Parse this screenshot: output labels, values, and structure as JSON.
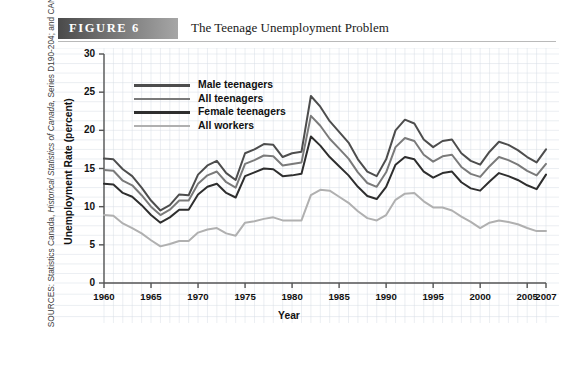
{
  "figure": {
    "banner_label": "FIGURE 6",
    "title": "The Teenage Unemployment Problem"
  },
  "source_note": {
    "prefix": "SOURCES: Statistics Canada, ",
    "italic": "Historical Statistics of Canada,",
    "suffix": " Series D190-204; and CANSIM II, Table 282-0002."
  },
  "colors": {
    "male_teenagers": "#4d4d4d",
    "all_teenagers": "#7a7a7a",
    "female_teenagers": "#2e2e2e",
    "all_workers": "#b0b0b0",
    "grid": "#d7dce4",
    "axis": "#555555",
    "banner_dark": "#4a4a4a",
    "banner_light": "#a6a6a6"
  },
  "chart_data": {
    "type": "line",
    "title": "The Teenage Unemployment Problem",
    "xlabel": "Year",
    "ylabel": "Unemployment Rate (percent)",
    "xlim": [
      1960,
      2007
    ],
    "ylim": [
      0,
      30
    ],
    "ytick_labels": [
      "0",
      "5",
      "10",
      "15",
      "20",
      "25",
      "30"
    ],
    "yticks": [
      0,
      5,
      10,
      15,
      20,
      25,
      30
    ],
    "xtick_labels": [
      "1960",
      "1965",
      "1970",
      "1975",
      "1980",
      "1985",
      "1990",
      "1995",
      "2000",
      "2005",
      "2007"
    ],
    "xticks": [
      1960,
      1965,
      1970,
      1975,
      1980,
      1985,
      1990,
      1995,
      2000,
      2005,
      2007
    ],
    "grid": true,
    "legend_position": "upper-left-inside",
    "x": [
      1960,
      1961,
      1962,
      1963,
      1964,
      1965,
      1966,
      1967,
      1968,
      1969,
      1970,
      1971,
      1972,
      1973,
      1974,
      1975,
      1976,
      1977,
      1978,
      1979,
      1980,
      1981,
      1982,
      1983,
      1984,
      1985,
      1986,
      1987,
      1988,
      1989,
      1990,
      1991,
      1992,
      1993,
      1994,
      1995,
      1996,
      1997,
      1998,
      1999,
      2000,
      2001,
      2002,
      2003,
      2004,
      2005,
      2006,
      2007
    ],
    "series": [
      {
        "name": "Male teenagers",
        "color": "#4d4d4d",
        "values": [
          16.3,
          16.2,
          14.9,
          14.0,
          12.5,
          10.8,
          9.5,
          10.2,
          11.6,
          11.5,
          14.2,
          15.4,
          16.0,
          14.4,
          13.5,
          17.0,
          17.5,
          18.2,
          18.1,
          16.5,
          17.0,
          17.2,
          24.5,
          23.1,
          21.2,
          19.8,
          18.4,
          16.2,
          14.6,
          14.0,
          16.2,
          20.0,
          21.4,
          20.9,
          18.8,
          17.8,
          18.6,
          18.8,
          17.0,
          16.0,
          15.5,
          17.2,
          18.5,
          18.1,
          17.4,
          16.5,
          15.8,
          17.5
        ]
      },
      {
        "name": "All teenagers",
        "color": "#7a7a7a",
        "values": [
          14.8,
          14.7,
          13.4,
          12.8,
          11.5,
          10.0,
          8.9,
          9.6,
          10.8,
          10.8,
          13.0,
          14.1,
          14.6,
          13.2,
          12.5,
          15.6,
          16.1,
          16.7,
          16.6,
          15.4,
          15.6,
          15.8,
          21.9,
          20.6,
          18.9,
          17.6,
          16.3,
          14.5,
          13.1,
          12.6,
          14.5,
          17.8,
          19.0,
          18.6,
          16.8,
          15.9,
          16.6,
          16.8,
          15.2,
          14.3,
          13.9,
          15.3,
          16.5,
          16.1,
          15.5,
          14.7,
          14.1,
          15.6
        ]
      },
      {
        "name": "Female teenagers",
        "color": "#2e2e2e",
        "values": [
          13.0,
          12.9,
          11.8,
          11.3,
          10.2,
          8.9,
          7.9,
          8.6,
          9.6,
          9.6,
          11.6,
          12.6,
          13.0,
          11.8,
          11.2,
          14.0,
          14.5,
          15.0,
          14.9,
          14.0,
          14.1,
          14.3,
          19.2,
          18.0,
          16.5,
          15.3,
          14.1,
          12.6,
          11.4,
          11.0,
          12.6,
          15.5,
          16.5,
          16.2,
          14.6,
          13.8,
          14.4,
          14.6,
          13.2,
          12.4,
          12.1,
          13.3,
          14.4,
          14.0,
          13.5,
          12.8,
          12.3,
          14.2
        ]
      },
      {
        "name": "All workers",
        "color": "#b0b0b0",
        "values": [
          8.9,
          8.8,
          7.8,
          7.2,
          6.5,
          5.6,
          4.8,
          5.1,
          5.5,
          5.5,
          6.6,
          7.0,
          7.2,
          6.5,
          6.2,
          7.9,
          8.1,
          8.4,
          8.6,
          8.2,
          8.2,
          8.2,
          11.5,
          12.2,
          12.1,
          11.3,
          10.5,
          9.4,
          8.5,
          8.2,
          8.9,
          10.9,
          11.7,
          11.8,
          10.7,
          9.9,
          9.9,
          9.5,
          8.7,
          8.0,
          7.2,
          7.9,
          8.2,
          8.0,
          7.7,
          7.2,
          6.8,
          6.8
        ]
      }
    ]
  },
  "legend": {
    "items": [
      {
        "label": "Male teenagers",
        "color": "#4d4d4d"
      },
      {
        "label": "All teenagers",
        "color": "#7a7a7a"
      },
      {
        "label": "Female teenagers",
        "color": "#2e2e2e"
      },
      {
        "label": "All workers",
        "color": "#b0b0b0"
      }
    ]
  }
}
